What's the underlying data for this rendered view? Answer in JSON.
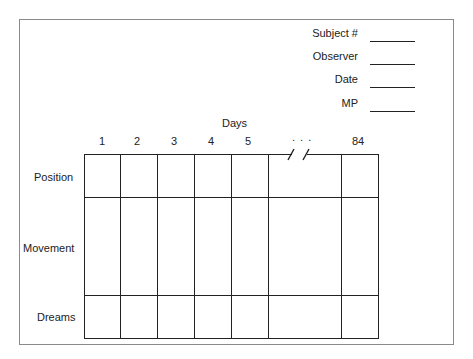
{
  "form": {
    "fields": [
      {
        "label": "Subject #",
        "value": ""
      },
      {
        "label": "Observer",
        "value": ""
      },
      {
        "label": "Date",
        "value": ""
      },
      {
        "label": "MP",
        "value": ""
      }
    ],
    "days_header": "Days",
    "day_columns": [
      "1",
      "2",
      "3",
      "4",
      "5",
      ". . .",
      "84"
    ],
    "rows": [
      "Position",
      "Movement",
      "Dreams"
    ]
  }
}
